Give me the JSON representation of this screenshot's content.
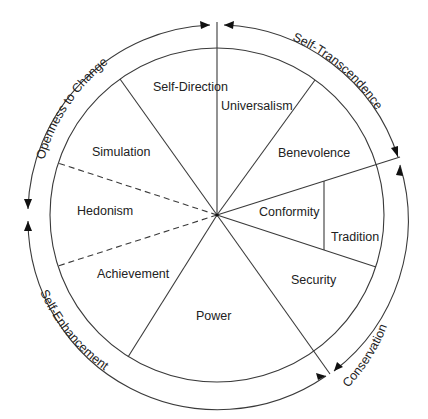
{
  "diagram": {
    "values": [
      {
        "label": "Self-Direction"
      },
      {
        "label": "Universalism"
      },
      {
        "label": "Benevolence"
      },
      {
        "label": "Conformity"
      },
      {
        "label": "Tradition"
      },
      {
        "label": "Security"
      },
      {
        "label": "Power"
      },
      {
        "label": "Achievement"
      },
      {
        "label": "Hedonism"
      },
      {
        "label": "Simulation"
      }
    ],
    "higher_order": [
      {
        "label": "Openness to Change"
      },
      {
        "label": "Self-Transcendence"
      },
      {
        "label": "Conservation"
      },
      {
        "label": "Self-Enhancement"
      }
    ],
    "colors": {
      "line": "#3a3a3a",
      "text": "#222222",
      "background": "#ffffff"
    }
  }
}
